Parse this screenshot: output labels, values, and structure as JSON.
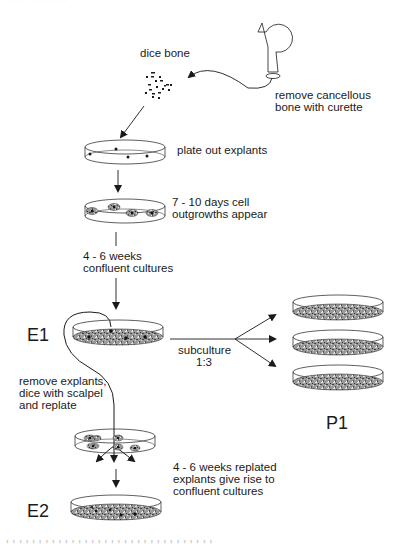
{
  "header": {
    "clipped_text": "- - - - - - - - -"
  },
  "steps": {
    "curette": {
      "label_line1": "remove cancellous",
      "label_line2": "bone with curette"
    },
    "dice": {
      "label": "dice bone"
    },
    "plate": {
      "label": "plate out explants"
    },
    "outgrowth": {
      "label_line1": "7 - 10 days cell",
      "label_line2": "outgrowths appear"
    },
    "confluent": {
      "label_line1": "4 - 6 weeks",
      "label_line2": "confluent cultures"
    },
    "e1": {
      "label": "E1"
    },
    "subculture": {
      "label_line1": "subculture",
      "label_line2": "1:3"
    },
    "p1": {
      "label": "P1"
    },
    "replate": {
      "label_line1": "remove explants,",
      "label_line2": "dice with scalpel",
      "label_line3": "and replate"
    },
    "replated": {
      "label_line1": "4 - 6 weeks replated",
      "label_line2": "explants give rise to",
      "label_line3": "confluent cultures"
    },
    "e2": {
      "label": "E2"
    }
  },
  "footer": {
    "clipped_caption": "' ' ' ' ' ' ' ' ' ' ' ' ' ' ' ' ' ' ' ' ' ' ' ' ' ' ' ' ' ' ' '"
  },
  "colors": {
    "line": "#1a1a1a",
    "culture_fill": "#8a8a8a",
    "background": "#ffffff"
  }
}
